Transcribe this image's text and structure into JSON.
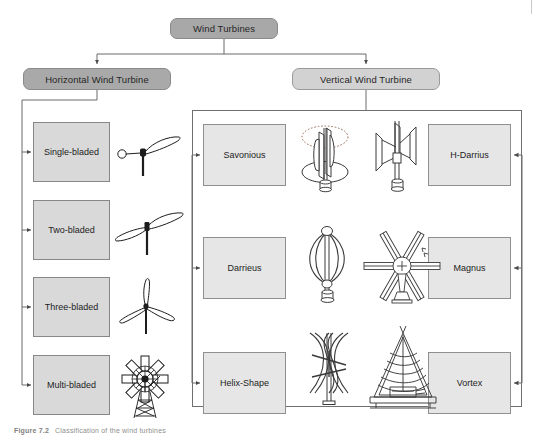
{
  "figure": {
    "caption_number": "Figure 7.2",
    "caption_text": "Classification of the wind turbines"
  },
  "root": {
    "label": "Wind Turbines"
  },
  "branches": {
    "horizontal": {
      "label": "Horizontal Wind Turbine",
      "items": [
        {
          "label": "Single-bladed",
          "illustration": "single-bladed-turbine-icon"
        },
        {
          "label": "Two-bladed",
          "illustration": "two-bladed-turbine-icon"
        },
        {
          "label": "Three-bladed",
          "illustration": "three-bladed-turbine-icon"
        },
        {
          "label": "Multi-bladed",
          "illustration": "multi-bladed-turbine-icon"
        }
      ]
    },
    "vertical": {
      "label": "Vertical Wind Turbine",
      "left_items": [
        {
          "label": "Savonious",
          "illustration": "savonious-turbine-icon"
        },
        {
          "label": "Darrieus",
          "illustration": "darrieus-turbine-icon"
        },
        {
          "label": "Helix-Shape",
          "illustration": "helix-shape-turbine-icon"
        }
      ],
      "right_items": [
        {
          "label": "H-Darrius",
          "illustration": "h-darrius-turbine-icon"
        },
        {
          "label": "Magnus",
          "illustration": "magnus-turbine-icon"
        },
        {
          "label": "Vortex",
          "illustration": "vortex-turbine-icon"
        }
      ]
    }
  },
  "colors": {
    "root_fill": "#a8a8a8",
    "horizontal_fill": "#a9a9a9",
    "vertical_fill": "#d2d2d2",
    "leaf_fill": "#d9d9d9",
    "leaf_fill_light": "#e6e6e6",
    "line": "#5a5a5a",
    "text": "#262626",
    "caption": "#8e8e8e"
  }
}
